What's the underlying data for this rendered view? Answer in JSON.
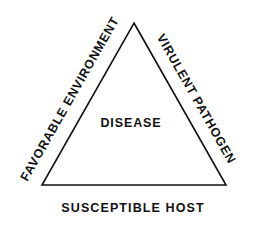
{
  "diagram": {
    "type": "epidemiologic-triangle",
    "background_color": "#ffffff",
    "line_color": "#111111",
    "text_color": "#111111",
    "line_width_px": 1.6,
    "shape": {
      "name": "triangle",
      "apex": {
        "x": 134,
        "y": 23
      },
      "bottom_left": {
        "x": 42,
        "y": 185
      },
      "bottom_right": {
        "x": 226,
        "y": 185
      }
    },
    "center_label": "DISEASE",
    "sides": [
      {
        "position": "left",
        "label": "FAVORABLE ENVIRONMENT",
        "rotation_deg": -60.4
      },
      {
        "position": "right",
        "label": "VIRULENT PATHOGEN",
        "rotation_deg": 60.4
      },
      {
        "position": "bottom",
        "label": "SUSCEPTIBLE HOST",
        "rotation_deg": 0
      }
    ]
  }
}
